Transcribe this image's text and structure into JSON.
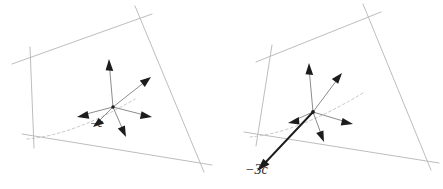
{
  "figure": {
    "title": "",
    "width": 443,
    "height": 189,
    "background_color": "#ffffff",
    "panel_count": 2
  },
  "colors": {
    "plane_edge": "#b6b6b6",
    "dashed_arc": "#c0c0c0",
    "vector_line": "#5a5a5a",
    "vector_head": "#1c1c1c",
    "bold_vector": "#1c1c1c",
    "label_text": "#2a2a2a",
    "background": "#ffffff"
  },
  "panels": [
    {
      "id": "left-panel",
      "name": "vector-diagram-minus-c",
      "label": "−c",
      "label_position": {
        "x": 90,
        "y": 118
      },
      "origin": {
        "x": 113,
        "y": 107
      },
      "plane_corners": [
        {
          "x": 25,
          "y": 59
        },
        {
          "x": 140,
          "y": 18
        },
        {
          "x": 198,
          "y": 157
        },
        {
          "x": 31,
          "y": 136
        }
      ],
      "dashed_arc": {
        "start": {
          "x": 27,
          "y": 139
        },
        "control": {
          "x": 78,
          "y": 132
        },
        "end": {
          "x": 135,
          "y": 99
        }
      },
      "vectors": [
        {
          "name": "vector-up",
          "dx": -4,
          "dy": -45,
          "style": "thin"
        },
        {
          "name": "vector-up-right",
          "dx": 38,
          "dy": -30,
          "style": "thin"
        },
        {
          "name": "vector-right",
          "dx": 39,
          "dy": 10,
          "style": "thin"
        },
        {
          "name": "vector-down-right",
          "dx": 13,
          "dy": 30,
          "style": "thin"
        },
        {
          "name": "vector-down-left",
          "dx": -19,
          "dy": 19,
          "style": "thin"
        },
        {
          "name": "vector-minus-c",
          "dx": -36,
          "dy": 10,
          "style": "thin"
        }
      ]
    },
    {
      "id": "right-panel",
      "name": "vector-diagram-minus-3c",
      "label": "−3c",
      "label_position": {
        "x": 245,
        "y": 163
      },
      "origin": {
        "x": 313,
        "y": 112
      },
      "plane_corners": [
        {
          "x": 268,
          "y": 57
        },
        {
          "x": 368,
          "y": 16
        },
        {
          "x": 425,
          "y": 155
        },
        {
          "x": 252,
          "y": 134
        }
      ],
      "dashed_arc": {
        "start": {
          "x": 250,
          "y": 137
        },
        "control": {
          "x": 300,
          "y": 130
        },
        "end": {
          "x": 363,
          "y": 93
        }
      },
      "vectors": [
        {
          "name": "vector-up",
          "dx": -5,
          "dy": -46,
          "style": "thin"
        },
        {
          "name": "vector-up-right",
          "dx": 30,
          "dy": -40,
          "style": "thin"
        },
        {
          "name": "vector-right",
          "dx": 40,
          "dy": 12,
          "style": "thin"
        },
        {
          "name": "vector-down-right",
          "dx": 11,
          "dy": 30,
          "style": "thin"
        },
        {
          "name": "vector-down-left",
          "dx": -22,
          "dy": 10,
          "style": "thin"
        },
        {
          "name": "vector-minus-3c",
          "dx": -56,
          "dy": 60,
          "style": "bold"
        }
      ]
    }
  ]
}
